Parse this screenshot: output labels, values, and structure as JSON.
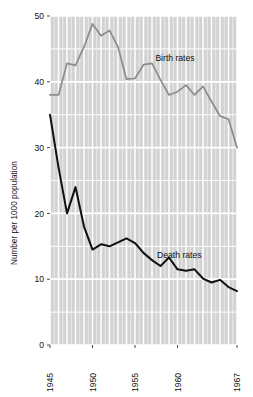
{
  "chart_data": {
    "type": "line",
    "title": "",
    "xlabel": "",
    "ylabel": "Number per 1000 population",
    "xlim": [
      1945,
      1967
    ],
    "ylim": [
      0,
      50
    ],
    "yticks": [
      0,
      10,
      20,
      30,
      40,
      50
    ],
    "ytick_labels": [
      "0",
      "10",
      "20",
      "30",
      "40",
      "50"
    ],
    "xticks": [
      1945,
      1950,
      1955,
      1960,
      1967
    ],
    "xtick_labels": [
      "1945",
      "1950",
      "1955",
      "1960",
      "1967"
    ],
    "grid": true,
    "grid_color": "#ffffff",
    "plot_background": "#d2d2d2",
    "minor_vertical_gridlines_per_year": true,
    "legend_position": "inline-annotations",
    "x": [
      1945,
      1946,
      1947,
      1948,
      1949,
      1950,
      1951,
      1952,
      1953,
      1954,
      1955,
      1956,
      1957,
      1958,
      1959,
      1960,
      1961,
      1962,
      1963,
      1964,
      1965,
      1966,
      1967
    ],
    "series": [
      {
        "name": "Birth rates",
        "color": "#8c8c8c",
        "label_x": 1957.4,
        "label_y": 43.2,
        "values": [
          38.0,
          38.0,
          42.8,
          42.5,
          45.3,
          48.8,
          47.0,
          47.8,
          45.3,
          40.4,
          40.5,
          42.6,
          42.8,
          40.3,
          38.0,
          38.5,
          39.5,
          38.0,
          39.3,
          37.0,
          34.8,
          34.3,
          30.0
        ]
      },
      {
        "name": "Death rates",
        "color": "#111111",
        "label_x": 1957.6,
        "label_y": 13.2,
        "values": [
          35.0,
          27.0,
          20.0,
          24.0,
          18.0,
          14.5,
          15.3,
          15.0,
          15.6,
          16.2,
          15.5,
          14.0,
          12.9,
          12.0,
          13.3,
          11.5,
          11.3,
          11.5,
          10.1,
          9.5,
          9.9,
          8.8,
          8.2
        ]
      }
    ]
  }
}
